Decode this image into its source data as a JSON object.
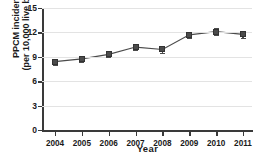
{
  "chart_data": {
    "type": "line",
    "title": "",
    "xlabel": "Year",
    "ylabel_line1": "PPCM incidence",
    "ylabel_line2": "(per 10,000 live births)",
    "categories": [
      "2004",
      "2005",
      "2006",
      "2007",
      "2008",
      "2009",
      "2010",
      "2011"
    ],
    "values": [
      8.4,
      8.75,
      9.3,
      10.2,
      9.9,
      11.7,
      12.1,
      11.75
    ],
    "errors": [
      0.35,
      0.35,
      0.35,
      0.4,
      0.4,
      0.4,
      0.45,
      0.45
    ],
    "ylim": [
      0,
      15
    ],
    "yticks": [
      "0",
      "3",
      "6",
      "9",
      "12",
      "15"
    ],
    "ytick_values": [
      0,
      3,
      6,
      9,
      12,
      15
    ],
    "grid": true,
    "legend": "none",
    "marker": "square",
    "series_color": "#4b4b4b",
    "axis_color": "#3a3a3a",
    "grid_color": "#e3e3e3",
    "background": "#ffffff"
  }
}
